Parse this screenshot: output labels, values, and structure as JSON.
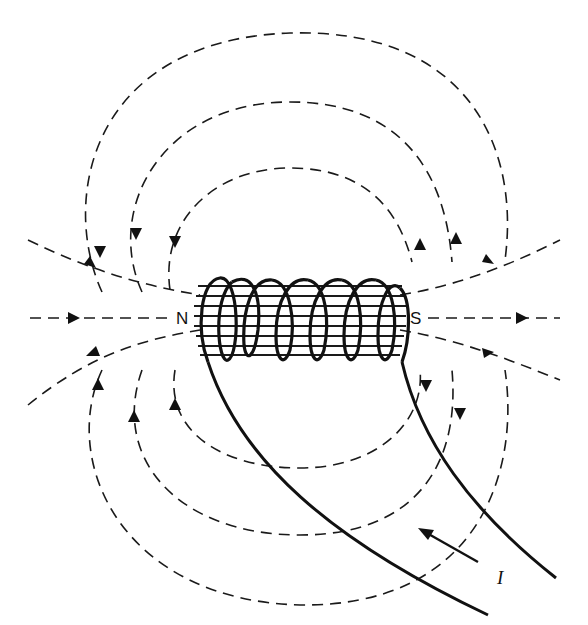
{
  "figure": {
    "labels": {
      "north": "N",
      "south": "S",
      "current": "I"
    },
    "coil": {
      "turns": 7,
      "stroke_color": "#111111"
    },
    "field_lines": {
      "style": "dashed",
      "color": "#1a1a1a",
      "arrow_direction_as_drawn": "enters near N end, exits near S end (external)"
    },
    "current_arrow": {
      "direction": "up-left along lead toward coil"
    }
  }
}
